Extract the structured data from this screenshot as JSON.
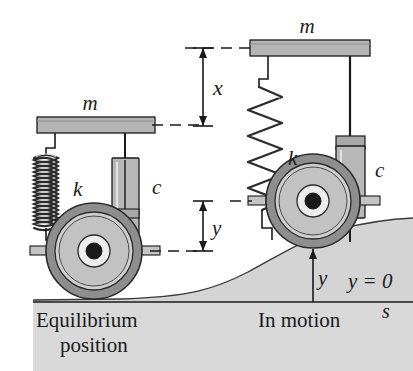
{
  "figure": {
    "background_color": "#ffffff",
    "ground_fill": "#d4d4d4",
    "body_fill": "#b5b5b5",
    "wheel_tire_fill": "#8e8e8e",
    "wheel_rim_fill": "#cfcfcf",
    "line_color": "#1a1a1a"
  },
  "labels": {
    "mass_left": "m",
    "mass_right": "m",
    "spring_left": "k",
    "spring_right": "k",
    "damper_left": "c",
    "damper_right": "c",
    "displacement_x": "x",
    "displacement_y_upper": "y",
    "displacement_y_ground": "y",
    "datum": "y = 0",
    "distance_axis": "s",
    "caption_left_line1": "Equilibrium",
    "caption_left_line2": "position",
    "caption_right": "In motion"
  },
  "diagram_data": {
    "type": "schematic",
    "systems": [
      {
        "name": "equilibrium-position",
        "mass_label": "m",
        "spring_label": "k",
        "spring_state": "compressed",
        "spring_coils": 9,
        "damper_label": "c",
        "damper_state": "compressed",
        "wheel_contact": "flat-ground",
        "vertical_displacement": 0
      },
      {
        "name": "in-motion",
        "mass_label": "m",
        "spring_label": "k",
        "spring_state": "extended",
        "spring_coils": 8,
        "damper_label": "c",
        "damper_state": "extended",
        "wheel_contact": "raised-road-profile",
        "vertical_displacement": "x"
      }
    ],
    "dimensions": [
      {
        "label": "x",
        "meaning": "mass displacement from equilibrium",
        "orientation": "vertical"
      },
      {
        "label": "y",
        "meaning": "wheel/road displacement from datum",
        "orientation": "vertical"
      }
    ],
    "datum_line": "y = 0",
    "horizontal_axis": "s"
  }
}
